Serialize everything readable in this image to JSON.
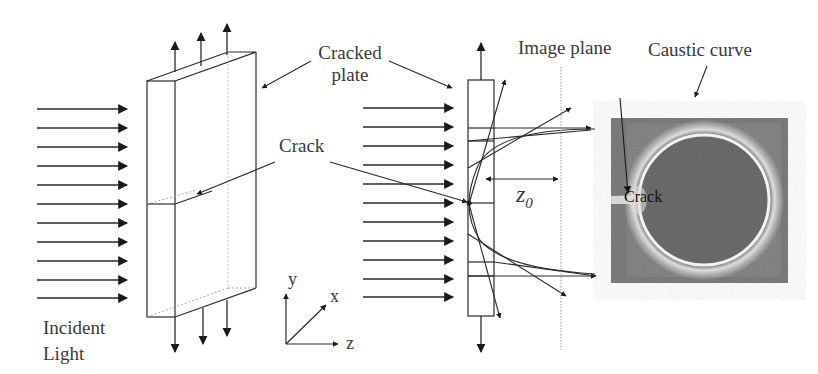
{
  "labels": {
    "incident_light": [
      "Incident",
      "Light"
    ],
    "cracked_plate": [
      "Cracked",
      "plate"
    ],
    "crack": "Crack",
    "image_plane": "Image plane",
    "caustic_curve": "Caustic curve",
    "z0": "z",
    "z0_sub": "0",
    "crack_in_image": "Crack"
  },
  "axes": {
    "x": "x",
    "y": "y",
    "z": "z"
  },
  "colors": {
    "line": "#2a2a2a",
    "text": "#3a3a3a",
    "image_bg": "#7a7a7a",
    "image_disk": "#6b6b6b",
    "caustic_ring": "#f2f2f2"
  },
  "incident_rays": {
    "count": 11,
    "left_group_x": [
      37,
      128
    ],
    "right_group_x": [
      363,
      455
    ]
  }
}
